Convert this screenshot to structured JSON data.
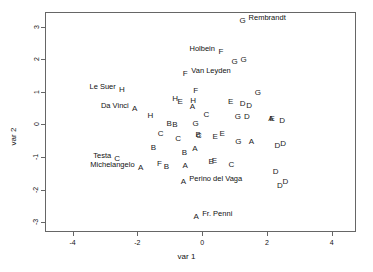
{
  "chart_data": {
    "type": "scatter",
    "title": "",
    "xlabel": "var 1",
    "ylabel": "var 2",
    "xlim": [
      -4.85,
      4.75
    ],
    "ylim": [
      -3.3,
      3.45
    ],
    "xticks": [
      -4,
      -2,
      0,
      2,
      4
    ],
    "xticklabels": [
      "-4",
      "-2",
      "0",
      "2",
      "4"
    ],
    "yticks": [
      3,
      2,
      1,
      0,
      -1,
      -2,
      -3
    ],
    "yticklabels": [
      "3",
      "2",
      "1",
      "0",
      "-1",
      "-2",
      "-3"
    ],
    "grid": false,
    "legend": false,
    "point_marker": "letter-glyph",
    "points": [
      {
        "label": "G",
        "x": 1.25,
        "y": 3.18,
        "name": "Rembrandt"
      },
      {
        "label": "F",
        "x": 0.58,
        "y": 2.23,
        "name": "Holbein"
      },
      {
        "label": "G",
        "x": 1.0,
        "y": 1.93,
        "name": ""
      },
      {
        "label": "G",
        "x": 1.28,
        "y": 1.97,
        "name": ""
      },
      {
        "label": "F",
        "x": -0.52,
        "y": 1.55,
        "name": "Van Leyden"
      },
      {
        "label": "H",
        "x": -2.48,
        "y": 1.05,
        "name": "Le Suer"
      },
      {
        "label": "F",
        "x": -0.2,
        "y": 1.02,
        "name": ""
      },
      {
        "label": "G",
        "x": 1.72,
        "y": 0.98,
        "name": ""
      },
      {
        "label": "H",
        "x": -0.83,
        "y": 0.78,
        "name": ""
      },
      {
        "label": "E",
        "x": -0.68,
        "y": 0.68,
        "name": ""
      },
      {
        "label": "H",
        "x": -0.28,
        "y": 0.72,
        "name": ""
      },
      {
        "label": "E",
        "x": 0.88,
        "y": 0.68,
        "name": ""
      },
      {
        "label": "D",
        "x": 1.25,
        "y": 0.63,
        "name": ""
      },
      {
        "label": "D",
        "x": 1.45,
        "y": 0.58,
        "name": ""
      },
      {
        "label": "A",
        "x": -2.08,
        "y": 0.48,
        "name": "Da Vinci"
      },
      {
        "label": "A",
        "x": -0.3,
        "y": 0.52,
        "name": ""
      },
      {
        "label": "H",
        "x": -1.6,
        "y": 0.26,
        "name": ""
      },
      {
        "label": "C",
        "x": 0.13,
        "y": 0.28,
        "name": ""
      },
      {
        "label": "G",
        "x": 1.1,
        "y": 0.24,
        "name": ""
      },
      {
        "label": "D",
        "x": 1.38,
        "y": 0.24,
        "name": ""
      },
      {
        "label": "A",
        "x": 2.12,
        "y": 0.17,
        "name": ""
      },
      {
        "label": "E",
        "x": 2.16,
        "y": 0.18,
        "name": ""
      },
      {
        "label": "D",
        "x": 2.47,
        "y": 0.1,
        "name": ""
      },
      {
        "label": "B",
        "x": -1.02,
        "y": 0.02,
        "name": ""
      },
      {
        "label": "B",
        "x": -0.84,
        "y": -0.03,
        "name": ""
      },
      {
        "label": "G",
        "x": -0.2,
        "y": 0.0,
        "name": ""
      },
      {
        "label": "C",
        "x": -1.28,
        "y": -0.3,
        "name": ""
      },
      {
        "label": "B",
        "x": -0.12,
        "y": -0.32,
        "name": ""
      },
      {
        "label": "C",
        "x": -0.1,
        "y": -0.34,
        "name": ""
      },
      {
        "label": "E",
        "x": 0.62,
        "y": -0.29,
        "name": ""
      },
      {
        "label": "E",
        "x": 0.4,
        "y": -0.4,
        "name": ""
      },
      {
        "label": "C",
        "x": -0.74,
        "y": -0.45,
        "name": ""
      },
      {
        "label": "G",
        "x": 1.12,
        "y": -0.54,
        "name": ""
      },
      {
        "label": "A",
        "x": 1.52,
        "y": -0.55,
        "name": ""
      },
      {
        "label": "D",
        "x": 2.5,
        "y": -0.6,
        "name": ""
      },
      {
        "label": "D",
        "x": 2.32,
        "y": -0.67,
        "name": ""
      },
      {
        "label": "B",
        "x": -1.5,
        "y": -0.72,
        "name": ""
      },
      {
        "label": "A",
        "x": -0.22,
        "y": -0.75,
        "name": ""
      },
      {
        "label": "B",
        "x": -0.55,
        "y": -0.87,
        "name": ""
      },
      {
        "label": "C",
        "x": -2.62,
        "y": -1.07,
        "name": "Testa"
      },
      {
        "label": "E",
        "x": 0.38,
        "y": -1.11,
        "name": ""
      },
      {
        "label": "E",
        "x": 0.28,
        "y": -1.16,
        "name": ""
      },
      {
        "label": "F",
        "x": -1.32,
        "y": -1.2,
        "name": ""
      },
      {
        "label": "A",
        "x": -0.52,
        "y": -1.26,
        "name": ""
      },
      {
        "label": "C",
        "x": 0.9,
        "y": -1.24,
        "name": ""
      },
      {
        "label": "B",
        "x": -1.1,
        "y": -1.3,
        "name": ""
      },
      {
        "label": "A",
        "x": -1.9,
        "y": -1.33,
        "name": "Michelangelo"
      },
      {
        "label": "D",
        "x": 2.27,
        "y": -1.47,
        "name": ""
      },
      {
        "label": "A",
        "x": -0.58,
        "y": -1.78,
        "name": "Perino del Vaga"
      },
      {
        "label": "D",
        "x": 2.57,
        "y": -1.78,
        "name": ""
      },
      {
        "label": "D",
        "x": 2.4,
        "y": -1.88,
        "name": ""
      },
      {
        "label": "A",
        "x": -0.18,
        "y": -2.85,
        "name": "Fr. Penni"
      }
    ],
    "annotations": [
      {
        "text": "Rembrandt",
        "x": 1.25,
        "y": 3.18,
        "anchor": "right"
      },
      {
        "text": "Holbein",
        "x": 0.58,
        "y": 2.23,
        "anchor": "left"
      },
      {
        "text": "Van Leyden",
        "x": -0.52,
        "y": 1.55,
        "anchor": "right"
      },
      {
        "text": "Le Suer",
        "x": -2.48,
        "y": 1.05,
        "anchor": "left"
      },
      {
        "text": "Da Vinci",
        "x": -2.08,
        "y": 0.48,
        "anchor": "left"
      },
      {
        "text": "Testa",
        "x": -2.62,
        "y": -1.07,
        "anchor": "left"
      },
      {
        "text": "Michelangelo",
        "x": -1.9,
        "y": -1.33,
        "anchor": "left"
      },
      {
        "text": "Perino del Vaga",
        "x": -0.58,
        "y": -1.78,
        "anchor": "right"
      },
      {
        "text": "Fr. Penni",
        "x": -0.18,
        "y": -2.85,
        "anchor": "right"
      }
    ]
  },
  "colors": {
    "frame": "#666666",
    "text": "#111111",
    "point": "#1a1a1a",
    "background": "#ffffff"
  }
}
